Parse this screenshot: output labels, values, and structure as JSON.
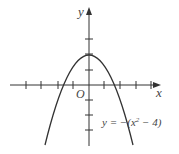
{
  "diagram": {
    "type": "function-graph",
    "axes": {
      "x_label": "x",
      "y_label": "y",
      "origin_label": "O"
    },
    "equation": {
      "prefix": "y = −(x",
      "exp": "2",
      "suffix": " − 4)"
    },
    "x_ticks": [
      -4,
      -3,
      -2,
      -1,
      1,
      2,
      3,
      4
    ],
    "y_ticks": [
      -3,
      -2,
      -1,
      1,
      2,
      3,
      4
    ],
    "curve": {
      "vertex": [
        0,
        4
      ],
      "roots": [
        -2,
        2
      ]
    },
    "colors": {
      "curve": "#333333",
      "axis": "#333333",
      "text": "#555555"
    }
  }
}
